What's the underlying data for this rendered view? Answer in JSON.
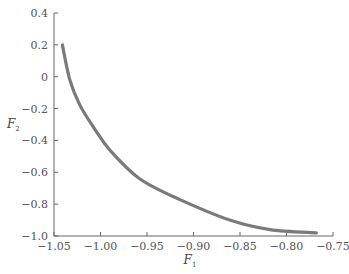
{
  "chart_data": {
    "type": "line",
    "title": "",
    "xlabel": "F1",
    "ylabel": "F2",
    "xlabel_main": "F",
    "xlabel_sub": "1",
    "ylabel_main": "F",
    "ylabel_sub": "2",
    "xlim": [
      -1.05,
      -0.75
    ],
    "ylim": [
      -1.0,
      0.4
    ],
    "xticks": [
      -1.05,
      -1.0,
      -0.95,
      -0.9,
      -0.85,
      -0.8,
      -0.75
    ],
    "xtick_labels": [
      "−1.05",
      "−1.00",
      "−0.95",
      "−0.90",
      "−0.85",
      "−0.80",
      "−0.75"
    ],
    "yticks": [
      0.4,
      0.2,
      0,
      -0.2,
      -0.4,
      -0.6,
      -0.8,
      -1.0
    ],
    "ytick_labels": [
      "0.4",
      "0.2",
      "0",
      "−0.2",
      "−0.4",
      "−0.6",
      "−0.8",
      "−1.0"
    ],
    "grid": false,
    "legend": null,
    "series": [
      {
        "name": "Pareto front",
        "color": "#7a7a7a",
        "x": [
          -1.041,
          -1.033,
          -1.022,
          -1.006,
          -0.99,
          -0.958,
          -0.915,
          -0.861,
          -0.818,
          -0.768
        ],
        "y": [
          0.2,
          -0.02,
          -0.18,
          -0.33,
          -0.46,
          -0.64,
          -0.77,
          -0.9,
          -0.96,
          -0.98
        ]
      }
    ]
  }
}
